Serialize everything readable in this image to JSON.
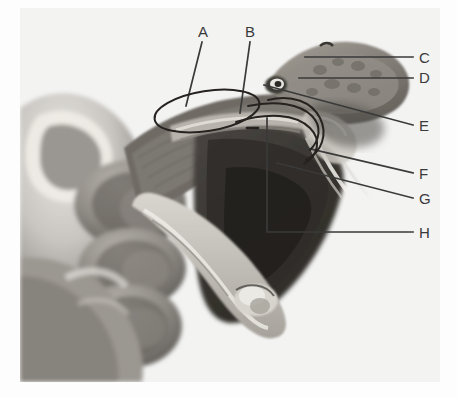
{
  "figure": {
    "kind": "annotated-photograph",
    "color_mode": "black-and-white halftone photograph",
    "background_color": "#ffffff",
    "plate_color": "#f2f2f1",
    "annotation_color": "#3a3a3a"
  },
  "labels": [
    {
      "id": "A",
      "text": "A",
      "x": 198,
      "y": 24,
      "leader": {
        "type": "line",
        "points": "202,42 186,106"
      }
    },
    {
      "id": "B",
      "text": "B",
      "x": 245,
      "y": 24,
      "leader": {
        "type": "line",
        "points": "250,42 240,113"
      }
    },
    {
      "id": "C",
      "text": "C",
      "x": 419,
      "y": 50,
      "leader": {
        "type": "line",
        "points": "413,57 305,57"
      }
    },
    {
      "id": "D",
      "text": "D",
      "x": 419,
      "y": 70,
      "leader": {
        "type": "line",
        "points": "413,78 299,78"
      }
    },
    {
      "id": "E",
      "text": "E",
      "x": 419,
      "y": 118,
      "leader": {
        "type": "line",
        "points": "413,125 264,85"
      }
    },
    {
      "id": "F",
      "text": "F",
      "x": 419,
      "y": 166,
      "leader": {
        "type": "line",
        "points": "413,173 294,145"
      }
    },
    {
      "id": "G",
      "text": "G",
      "x": 419,
      "y": 191,
      "leader": {
        "type": "line",
        "points": "413,198 277,163"
      }
    },
    {
      "id": "H",
      "text": "H",
      "x": 419,
      "y": 225,
      "leader": {
        "type": "bracket",
        "points": "267,118 267,232 413,232"
      }
    }
  ],
  "overlay_marks": [
    {
      "name": "venom-gland-outline",
      "shape": "ellipse",
      "cx": 207,
      "cy": 111,
      "rx": 53,
      "ry": 20,
      "rotation": -9
    },
    {
      "name": "duct-curve-upper",
      "shape": "path",
      "description": "long curve from gland toward fang sheath"
    },
    {
      "name": "duct-curve-lower",
      "shape": "path",
      "description": "second parallel curve beneath the first"
    },
    {
      "name": "fang-sheath-hook",
      "shape": "path",
      "description": "hooked curve around the fang base"
    },
    {
      "name": "tick-mark",
      "shape": "line",
      "x1": 247,
      "y1": 128,
      "x2": 258,
      "y2": 128
    }
  ]
}
